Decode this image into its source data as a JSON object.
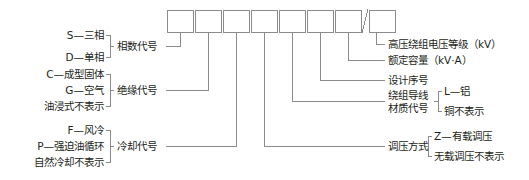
{
  "diagram": {
    "stroke_color": "#8c8c8c",
    "text_color": "#231f20",
    "box_count": 8,
    "separator_glyph": "/",
    "boxes": [
      {
        "index": 1,
        "label": ""
      },
      {
        "index": 2,
        "label": ""
      },
      {
        "index": 3,
        "label": ""
      },
      {
        "index": 4,
        "label": ""
      },
      {
        "index": 5,
        "label": ""
      },
      {
        "index": 6,
        "label": ""
      },
      {
        "index": 7,
        "label": ""
      },
      {
        "index": 8,
        "label": ""
      }
    ]
  },
  "left_groups": [
    {
      "name": "phase",
      "group_label": "相数代号",
      "options": [
        "S—三相",
        "D—单相"
      ]
    },
    {
      "name": "insulation",
      "group_label": "绝缘代号",
      "options": [
        "C—成型固体",
        "G—空气",
        "油浸式不表示"
      ]
    },
    {
      "name": "cooling",
      "group_label": "冷却代号",
      "options": [
        "F—风冷",
        "P—强迫油循环",
        "自然冷却不表示"
      ]
    }
  ],
  "right_groups": [
    {
      "name": "hv-voltage-class",
      "label_line1": "高压绕组电压等级（kV）",
      "label_line2": "",
      "options": []
    },
    {
      "name": "rated-capacity",
      "label_line1": "额定容量（kV·A）",
      "label_line2": "",
      "options": []
    },
    {
      "name": "design-serial",
      "label_line1": "设计序号",
      "label_line2": "",
      "options": []
    },
    {
      "name": "winding-conductor-material",
      "label_line1": "绕组导线",
      "label_line2": "材质代号",
      "options": [
        "L—铝",
        "铜不表示"
      ]
    },
    {
      "name": "voltage-regulation-mode",
      "label_line1": "调压方式",
      "label_line2": "",
      "options": [
        "Z—有载调压",
        "无载调压不表示"
      ]
    }
  ]
}
